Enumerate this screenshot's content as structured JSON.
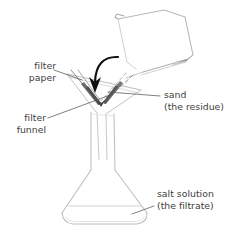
{
  "diagram": {
    "background_color": "#ffffff",
    "ink_color": "#3d3d3d",
    "glass_color": "#b9b9b9",
    "residue_color": "#6e6e6e",
    "arrow_color": "#1a1a1a",
    "labels": {
      "filter_paper": {
        "line1": "filter",
        "line2": "paper"
      },
      "filter_funnel": {
        "line1": "filter",
        "line2": "funnel"
      },
      "sand": {
        "line1": "sand",
        "line2": "(the residue)"
      },
      "salt_solution": {
        "line1": "salt solution",
        "line2": "(the filtrate)"
      }
    },
    "parts": {
      "beaker": "tilted-beaker-pouring",
      "funnel": "conical-filter-funnel",
      "paper": "folded-filter-paper-cone",
      "residue": "sand-in-filter-paper",
      "flask": "conical-erlenmeyer-flask",
      "liquid": "filtrate-level-line",
      "arrow": "curved-pour-arrow"
    }
  }
}
